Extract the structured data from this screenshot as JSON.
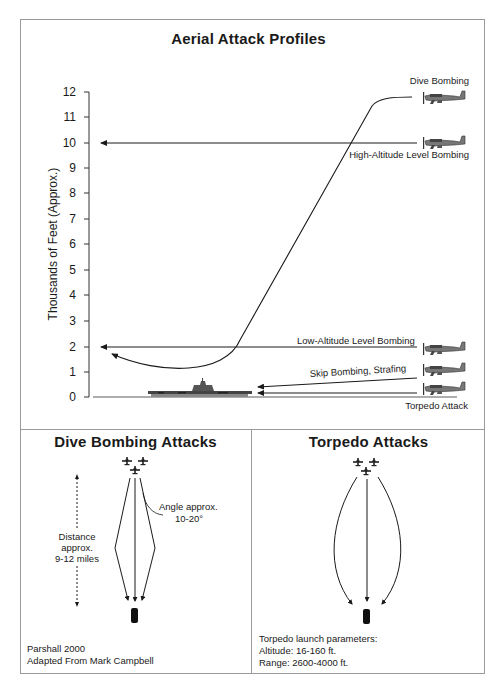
{
  "top_panel": {
    "title": "Aerial Attack Profiles",
    "y_axis_label": "Thousands of Feet (Approx.)",
    "y_ticks": [
      "12",
      "11",
      "10",
      "9",
      "8",
      "7",
      "6",
      "5",
      "4",
      "3",
      "2",
      "1",
      "0"
    ],
    "profiles": [
      {
        "label": "Dive Bombing",
        "icon": "aircraft-icon"
      },
      {
        "label": "High-Altitude Level Bombing",
        "icon": "aircraft-icon"
      },
      {
        "label": "Low-Altitude Level Bombing",
        "icon": "aircraft-icon"
      },
      {
        "label": "Skip Bombing, Strafing",
        "icon": "aircraft-icon"
      },
      {
        "label": "Torpedo Attack",
        "icon": "aircraft-icon"
      }
    ],
    "target_icon": "aircraft-carrier-icon"
  },
  "dive_panel": {
    "title": "Dive Bombing Attacks",
    "angle_note_line1": "Angle approx.",
    "angle_note_line2": "10-20°",
    "distance_line1": "Distance",
    "distance_line2": "approx.",
    "distance_line3": "9-12 miles",
    "credit_line1": "Parshall 2000",
    "credit_line2": "Adapted From Mark Campbell"
  },
  "torpedo_panel": {
    "title": "Torpedo Attacks",
    "params_line1": "Torpedo launch parameters:",
    "params_line2": "Altitude: 16-160 ft.",
    "params_line3": "Range: 2600-4000 ft."
  },
  "colors": {
    "ink": "#1a1a1a",
    "frame": "#9a9a9a",
    "ship": "#555555"
  }
}
